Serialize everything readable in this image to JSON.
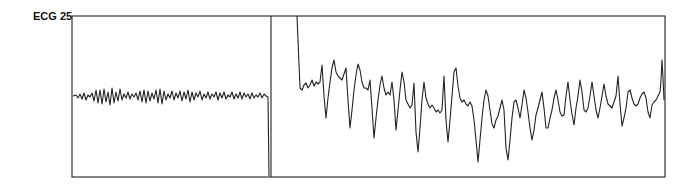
{
  "lead": {
    "label": "ECG 25"
  },
  "colors": {
    "trace": "#222222",
    "frame": "#333333",
    "background": "#ffffff"
  },
  "chart_data": {
    "type": "line",
    "title": "ECG 25",
    "xlabel": "",
    "ylabel": "",
    "grid": false,
    "legend": "none",
    "frame": {
      "x0": 72,
      "y0": 16,
      "x1": 665,
      "y1": 177,
      "divider_x": 271
    },
    "series": [
      {
        "name": "segment-1-low-amplitude",
        "points": [
          [
            73,
            96
          ],
          [
            76,
            95
          ],
          [
            78,
            98
          ],
          [
            80,
            94
          ],
          [
            82,
            99
          ],
          [
            84,
            93
          ],
          [
            86,
            100
          ],
          [
            88,
            95
          ],
          [
            90,
            97
          ],
          [
            92,
            93
          ],
          [
            94,
            101
          ],
          [
            96,
            90
          ],
          [
            98,
            103
          ],
          [
            100,
            90
          ],
          [
            102,
            104
          ],
          [
            104,
            89
          ],
          [
            106,
            102
          ],
          [
            108,
            92
          ],
          [
            110,
            105
          ],
          [
            112,
            88
          ],
          [
            114,
            103
          ],
          [
            116,
            92
          ],
          [
            118,
            101
          ],
          [
            120,
            89
          ],
          [
            122,
            100
          ],
          [
            124,
            94
          ],
          [
            126,
            98
          ],
          [
            128,
            92
          ],
          [
            130,
            99
          ],
          [
            132,
            94
          ],
          [
            134,
            97
          ],
          [
            136,
            93
          ],
          [
            138,
            100
          ],
          [
            140,
            91
          ],
          [
            142,
            102
          ],
          [
            144,
            90
          ],
          [
            146,
            103
          ],
          [
            148,
            91
          ],
          [
            150,
            101
          ],
          [
            152,
            93
          ],
          [
            154,
            99
          ],
          [
            156,
            90
          ],
          [
            158,
            103
          ],
          [
            160,
            89
          ],
          [
            162,
            104
          ],
          [
            164,
            91
          ],
          [
            166,
            100
          ],
          [
            168,
            94
          ],
          [
            170,
            98
          ],
          [
            172,
            91
          ],
          [
            174,
            100
          ],
          [
            176,
            93
          ],
          [
            178,
            98
          ],
          [
            180,
            91
          ],
          [
            182,
            101
          ],
          [
            184,
            92
          ],
          [
            186,
            99
          ],
          [
            188,
            90
          ],
          [
            190,
            102
          ],
          [
            192,
            92
          ],
          [
            194,
            100
          ],
          [
            196,
            93
          ],
          [
            198,
            97
          ],
          [
            200,
            91
          ],
          [
            202,
            100
          ],
          [
            204,
            94
          ],
          [
            206,
            98
          ],
          [
            208,
            92
          ],
          [
            210,
            99
          ],
          [
            212,
            94
          ],
          [
            214,
            97
          ],
          [
            216,
            92
          ],
          [
            218,
            100
          ],
          [
            220,
            93
          ],
          [
            222,
            98
          ],
          [
            224,
            92
          ],
          [
            226,
            99
          ],
          [
            228,
            95
          ],
          [
            230,
            97
          ],
          [
            232,
            92
          ],
          [
            234,
            99
          ],
          [
            236,
            94
          ],
          [
            238,
            98
          ],
          [
            240,
            92
          ],
          [
            242,
            99
          ],
          [
            244,
            93
          ],
          [
            246,
            97
          ],
          [
            248,
            94
          ],
          [
            250,
            99
          ],
          [
            252,
            93
          ],
          [
            254,
            98
          ],
          [
            256,
            95
          ],
          [
            258,
            97
          ],
          [
            260,
            93
          ],
          [
            262,
            98
          ],
          [
            264,
            94
          ],
          [
            266,
            96
          ],
          [
            268,
            97
          ],
          [
            269,
            176
          ]
        ]
      },
      {
        "name": "segment-2-wide-complex",
        "points": [
          [
            297,
            16
          ],
          [
            298,
            40
          ],
          [
            300,
            88
          ],
          [
            302,
            90
          ],
          [
            304,
            85
          ],
          [
            306,
            83
          ],
          [
            308,
            88
          ],
          [
            310,
            85
          ],
          [
            312,
            80
          ],
          [
            314,
            86
          ],
          [
            316,
            82
          ],
          [
            318,
            84
          ],
          [
            320,
            82
          ],
          [
            322,
            65
          ],
          [
            324,
            96
          ],
          [
            326,
            118
          ],
          [
            328,
            98
          ],
          [
            330,
            82
          ],
          [
            332,
            68
          ],
          [
            334,
            60
          ],
          [
            336,
            72
          ],
          [
            338,
            76
          ],
          [
            340,
            78
          ],
          [
            342,
            80
          ],
          [
            344,
            74
          ],
          [
            346,
            68
          ],
          [
            348,
            100
          ],
          [
            350,
            128
          ],
          [
            352,
            110
          ],
          [
            354,
            90
          ],
          [
            356,
            75
          ],
          [
            358,
            64
          ],
          [
            360,
            70
          ],
          [
            362,
            82
          ],
          [
            364,
            88
          ],
          [
            366,
            88
          ],
          [
            368,
            90
          ],
          [
            370,
            80
          ],
          [
            372,
            108
          ],
          [
            374,
            138
          ],
          [
            376,
            118
          ],
          [
            378,
            100
          ],
          [
            380,
            85
          ],
          [
            382,
            76
          ],
          [
            384,
            88
          ],
          [
            386,
            95
          ],
          [
            388,
            92
          ],
          [
            390,
            95
          ],
          [
            392,
            82
          ],
          [
            394,
            100
          ],
          [
            396,
            130
          ],
          [
            398,
            110
          ],
          [
            400,
            90
          ],
          [
            402,
            72
          ],
          [
            404,
            82
          ],
          [
            406,
            100
          ],
          [
            408,
            104
          ],
          [
            410,
            108
          ],
          [
            412,
            105
          ],
          [
            414,
            83
          ],
          [
            416,
            132
          ],
          [
            418,
            152
          ],
          [
            420,
            128
          ],
          [
            422,
            100
          ],
          [
            424,
            82
          ],
          [
            426,
            98
          ],
          [
            428,
            104
          ],
          [
            430,
            108
          ],
          [
            432,
            105
          ],
          [
            434,
            108
          ],
          [
            436,
            112
          ],
          [
            438,
            110
          ],
          [
            440,
            113
          ],
          [
            442,
            110
          ],
          [
            444,
            76
          ],
          [
            446,
            120
          ],
          [
            448,
            142
          ],
          [
            450,
            120
          ],
          [
            452,
            96
          ],
          [
            454,
            72
          ],
          [
            456,
            68
          ],
          [
            458,
            86
          ],
          [
            460,
            98
          ],
          [
            462,
            102
          ],
          [
            464,
            100
          ],
          [
            466,
            104
          ],
          [
            468,
            106
          ],
          [
            470,
            102
          ],
          [
            472,
            106
          ],
          [
            474,
            120
          ],
          [
            476,
            140
          ],
          [
            478,
            162
          ],
          [
            480,
            140
          ],
          [
            482,
            118
          ],
          [
            484,
            100
          ],
          [
            486,
            90
          ],
          [
            488,
            96
          ],
          [
            490,
            110
          ],
          [
            492,
            124
          ],
          [
            494,
            128
          ],
          [
            496,
            120
          ],
          [
            498,
            116
          ],
          [
            500,
            108
          ],
          [
            502,
            100
          ],
          [
            504,
            110
          ],
          [
            506,
            148
          ],
          [
            508,
            160
          ],
          [
            510,
            140
          ],
          [
            512,
            118
          ],
          [
            514,
            102
          ],
          [
            516,
            100
          ],
          [
            518,
            108
          ],
          [
            520,
            118
          ],
          [
            522,
            105
          ],
          [
            524,
            90
          ],
          [
            526,
            98
          ],
          [
            528,
            112
          ],
          [
            530,
            128
          ],
          [
            532,
            140
          ],
          [
            534,
            130
          ],
          [
            536,
            115
          ],
          [
            538,
            108
          ],
          [
            540,
            100
          ],
          [
            542,
            92
          ],
          [
            544,
            108
          ],
          [
            546,
            128
          ],
          [
            548,
            128
          ],
          [
            550,
            118
          ],
          [
            552,
            110
          ],
          [
            554,
            98
          ],
          [
            556,
            90
          ],
          [
            558,
            100
          ],
          [
            560,
            112
          ],
          [
            562,
            116
          ],
          [
            564,
            115
          ],
          [
            566,
            96
          ],
          [
            568,
            82
          ],
          [
            570,
            100
          ],
          [
            572,
            114
          ],
          [
            574,
            125
          ],
          [
            576,
            108
          ],
          [
            578,
            96
          ],
          [
            580,
            80
          ],
          [
            582,
            92
          ],
          [
            584,
            110
          ],
          [
            586,
            112
          ],
          [
            588,
            108
          ],
          [
            590,
            96
          ],
          [
            592,
            82
          ],
          [
            594,
            96
          ],
          [
            596,
            110
          ],
          [
            598,
            118
          ],
          [
            600,
            108
          ],
          [
            602,
            96
          ],
          [
            604,
            84
          ],
          [
            606,
            96
          ],
          [
            608,
            104
          ],
          [
            610,
            106
          ],
          [
            612,
            108
          ],
          [
            614,
            102
          ],
          [
            616,
            96
          ],
          [
            618,
            76
          ],
          [
            620,
            104
          ],
          [
            622,
            126
          ],
          [
            624,
            118
          ],
          [
            626,
            108
          ],
          [
            628,
            92
          ],
          [
            630,
            90
          ],
          [
            632,
            98
          ],
          [
            634,
            104
          ],
          [
            636,
            106
          ],
          [
            638,
            104
          ],
          [
            640,
            98
          ],
          [
            642,
            94
          ],
          [
            644,
            92
          ],
          [
            646,
            98
          ],
          [
            648,
            112
          ],
          [
            650,
            118
          ],
          [
            652,
            105
          ],
          [
            654,
            102
          ],
          [
            656,
            100
          ],
          [
            658,
            96
          ],
          [
            660,
            92
          ],
          [
            661,
            80
          ],
          [
            662,
            60
          ],
          [
            663,
            78
          ],
          [
            664,
            100
          ]
        ]
      }
    ]
  }
}
